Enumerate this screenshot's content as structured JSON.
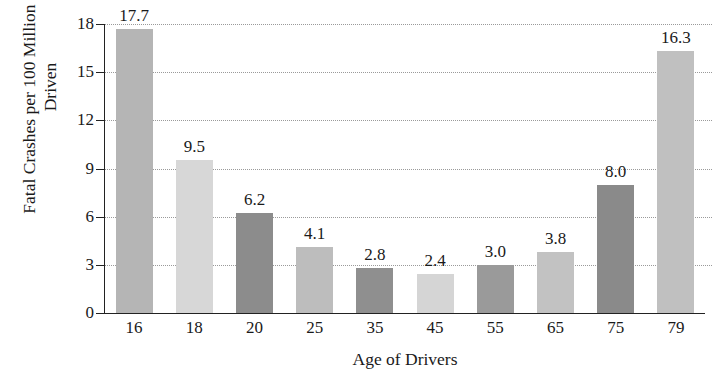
{
  "chart_data": {
    "type": "bar",
    "title": "",
    "xlabel": "Age of Drivers",
    "ylabel": "Fatal Crashes per 100 Million Miles Driven",
    "categories": [
      "16",
      "18",
      "20",
      "25",
      "35",
      "45",
      "55",
      "65",
      "75",
      "79"
    ],
    "values": [
      17.7,
      9.5,
      6.2,
      4.1,
      2.8,
      2.4,
      3.0,
      3.8,
      8.0,
      16.3
    ],
    "value_labels": [
      "17.7",
      "9.5",
      "6.2",
      "4.1",
      "2.8",
      "2.4",
      "3.0",
      "3.8",
      "8.0",
      "16.3"
    ],
    "bar_colors": [
      "#b5b5b5",
      "#d7d7d7",
      "#8c8c8c",
      "#bdbdbd",
      "#8f8f8f",
      "#d5d5d5",
      "#9a9a9a",
      "#c2c2c2",
      "#8a8a8a",
      "#c0c0c0"
    ],
    "ylim": [
      0,
      18
    ],
    "yticks": [
      0,
      3,
      6,
      9,
      12,
      15,
      18
    ],
    "ytick_labels": [
      "0",
      "3",
      "6",
      "9",
      "12",
      "15",
      "18"
    ],
    "grid": true,
    "grid_style": "dotted",
    "legend": null,
    "orientation": "vertical",
    "axis_color": "#222222",
    "grid_color": "#9a9a9a",
    "text_color": "#1a1a1a",
    "background": "#ffffff"
  }
}
